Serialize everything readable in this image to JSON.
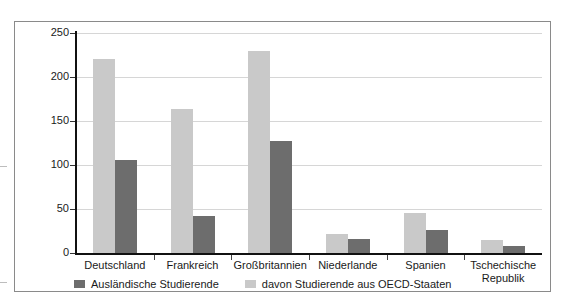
{
  "chart_data": {
    "type": "bar",
    "title": "",
    "subtitle": "",
    "xlabel": "",
    "ylabel": "",
    "ylim": [
      0,
      250
    ],
    "yticks": [
      0,
      50,
      100,
      150,
      200,
      250
    ],
    "ytick_labels": [
      "0",
      "50",
      "100",
      "150",
      "200",
      "250"
    ],
    "grid": "horizontal",
    "legend_position": "bottom-left",
    "categories": [
      "Deutschland",
      "Frankreich",
      "Großbritannien",
      "Niederlande",
      "Spanien",
      "Tschechische Republik"
    ],
    "series": [
      {
        "name": "Ausländische Studierende",
        "color": "#6d6d6d",
        "values": [
          106,
          42,
          127,
          16,
          26,
          8
        ]
      },
      {
        "name": "davon Studierende aus OECD-Staaten",
        "color": "#c9c9c9",
        "values": [
          220,
          164,
          229,
          22,
          46,
          15
        ]
      }
    ],
    "series_draw_order": [
      "davon Studierende aus OECD-Staaten",
      "Ausländische Studierende"
    ],
    "legend_order": [
      "Ausländische Studierende",
      "davon Studierende aus OECD-Staaten"
    ],
    "units": "Tausend (in thousands)"
  },
  "legend": {
    "entries": [
      {
        "label": "Ausländische Studierende",
        "swatch": "dark"
      },
      {
        "label": "davon Studierende aus OECD-Staaten",
        "swatch": "light"
      }
    ]
  },
  "axes": {
    "y_tick_labels": [
      "250",
      "200",
      "150",
      "100",
      "50",
      "0"
    ]
  },
  "colors": {
    "series_light": "#c9c9c9",
    "series_dark": "#6d6d6d",
    "axis": "#111111",
    "grid": "#d6d6d6",
    "frame": "#8a8a8a",
    "text": "#1a1a1a",
    "background": "#ffffff"
  }
}
